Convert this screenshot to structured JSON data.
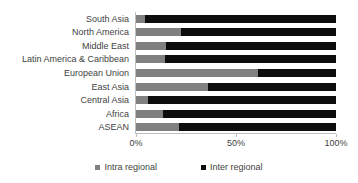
{
  "chart_data": {
    "type": "bar",
    "orientation": "horizontal",
    "stacked": true,
    "stack_mode": "percent",
    "title": "",
    "xlabel": "",
    "ylabel": "",
    "xlim": [
      0,
      100
    ],
    "grid": false,
    "legend_position": "bottom",
    "categories": [
      "South Asia",
      "North America",
      "Middle East",
      "Latin America & Caribbean",
      "European Union",
      "East Asia",
      "Central Asia",
      "Africa",
      "ASEAN"
    ],
    "series": [
      {
        "name": "Intra regional",
        "color": "#808080",
        "values": [
          4.5,
          22.5,
          15.0,
          14.5,
          61.0,
          36.0,
          6.0,
          13.5,
          21.5
        ]
      },
      {
        "name": "Inter regional",
        "color": "#0D0D0D",
        "values": [
          95.5,
          77.5,
          85.0,
          85.5,
          39.0,
          64.0,
          94.0,
          86.5,
          78.5
        ]
      }
    ],
    "x_ticks": [
      {
        "value": 0,
        "label": "0%"
      },
      {
        "value": 50,
        "label": "50%"
      },
      {
        "value": 100,
        "label": "100%"
      }
    ],
    "legend": [
      {
        "label": "Intra regional",
        "color": "#808080",
        "swatch": "square-marker-icon"
      },
      {
        "label": "Inter regional",
        "color": "#0D0D0D",
        "swatch": "square-marker-icon"
      }
    ]
  },
  "colors": {
    "intra": "#808080",
    "inter": "#0D0D0D",
    "axis": "#BFBFBF",
    "text": "#3F3F3F",
    "background": "#FFFFFF"
  }
}
